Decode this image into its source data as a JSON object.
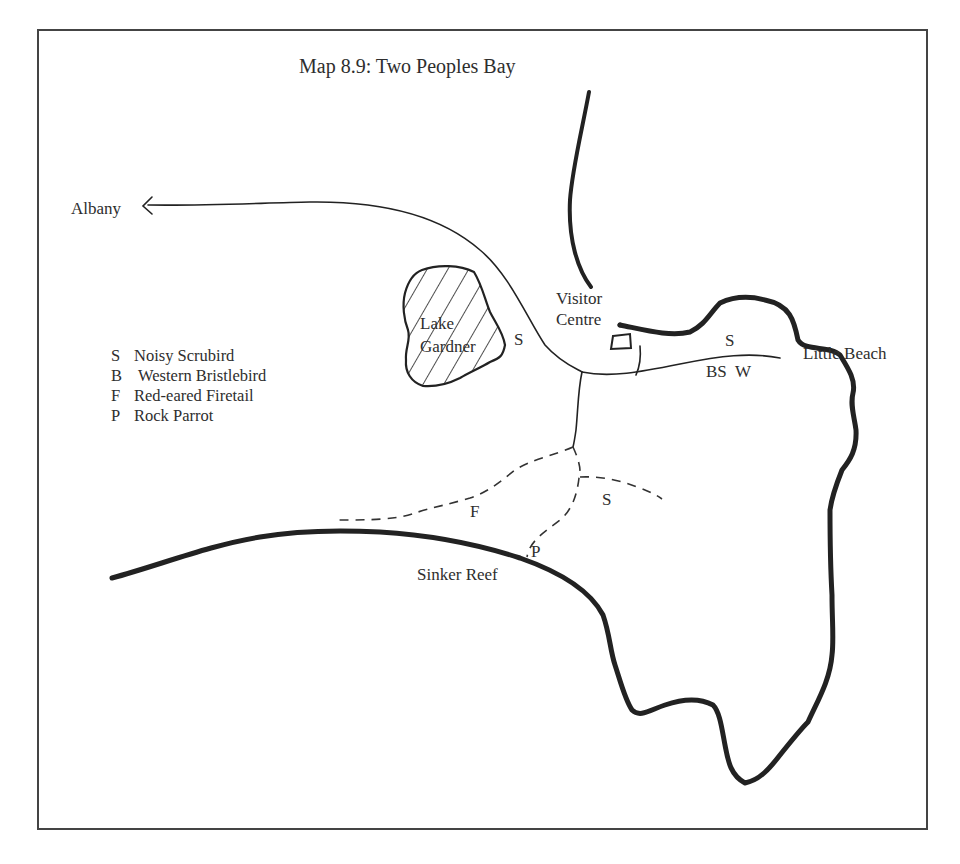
{
  "map": {
    "title": "Map 8.9:  Two Peoples Bay",
    "places": {
      "albany": "Albany",
      "lake_line1": "Lake",
      "lake_line2": "Gardner",
      "visitor_line1": "Visitor",
      "visitor_line2": "Centre",
      "little_beach": "Little Beach",
      "sinker_reef": "Sinker Reef"
    },
    "codes": {
      "lake_s": "S",
      "road_s": "S",
      "road_bsw": "BS  W",
      "track_f": "F",
      "track_s": "S",
      "track_p": "P"
    },
    "legend": [
      {
        "code": "S",
        "label": "Noisy Scrubird"
      },
      {
        "code": "B",
        "label": "Western Bristlebird"
      },
      {
        "code": "F",
        "label": "Red-eared Firetail"
      },
      {
        "code": "P",
        "label": "Rock Parrot"
      }
    ],
    "line_styles": {
      "coast": "thick solid",
      "road": "thin solid",
      "track": "dashed"
    },
    "colors": {
      "ink": "#222222",
      "paper": "#ffffff"
    }
  }
}
